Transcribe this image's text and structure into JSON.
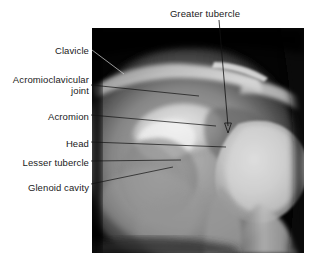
{
  "figure": {
    "type": "radiograph",
    "region": "shoulder",
    "view": "anteroposterior",
    "panel": {
      "background_color": "#000000",
      "left": 92,
      "top": 28,
      "width": 212,
      "height": 225
    },
    "page_background": "#ffffff",
    "label_color": "#1a1a1a",
    "leader_color": "#111111"
  },
  "labels": [
    {
      "id": "clavicle",
      "text": "Clavicle",
      "align": "right",
      "x": 89,
      "y": 45,
      "leader": {
        "type": "line",
        "points": [
          [
            92,
            50
          ],
          [
            124,
            74
          ]
        ],
        "color": "#d9d9d9"
      }
    },
    {
      "id": "acromioclavicular-joint",
      "text": "Acromioclavicular",
      "text2": "joint",
      "align": "right",
      "x": 89,
      "y": 74,
      "leader": {
        "type": "line",
        "points": [
          [
            91,
            85
          ],
          [
            199,
            96
          ]
        ],
        "color": "#111111"
      }
    },
    {
      "id": "acromion",
      "text": "Acromion",
      "align": "right",
      "x": 89,
      "y": 111,
      "leader": {
        "type": "line",
        "points": [
          [
            91,
            115
          ],
          [
            216,
            126
          ]
        ],
        "color": "#111111"
      }
    },
    {
      "id": "head",
      "text": "Head",
      "align": "right",
      "x": 89,
      "y": 138,
      "leader": {
        "type": "line",
        "points": [
          [
            91,
            142
          ],
          [
            226,
            147
          ]
        ],
        "color": "#111111"
      }
    },
    {
      "id": "lesser-tubercle",
      "text": "Lesser tubercle",
      "align": "right",
      "x": 89,
      "y": 157,
      "leader": {
        "type": "line",
        "points": [
          [
            91,
            161
          ],
          [
            181,
            160
          ]
        ],
        "color": "#111111"
      }
    },
    {
      "id": "glenoid-cavity",
      "text": "Glenoid cavity",
      "align": "right",
      "x": 89,
      "y": 182,
      "leader": {
        "type": "line",
        "points": [
          [
            91,
            184
          ],
          [
            173,
            167
          ]
        ],
        "color": "#111111"
      }
    },
    {
      "id": "greater-tubercle",
      "text": "Greater tubercle",
      "align": "center",
      "x": 205,
      "y": 8,
      "leader": {
        "type": "arrow",
        "points": [
          [
            219,
            20
          ],
          [
            228,
            130
          ]
        ],
        "color": "#111111"
      }
    }
  ]
}
